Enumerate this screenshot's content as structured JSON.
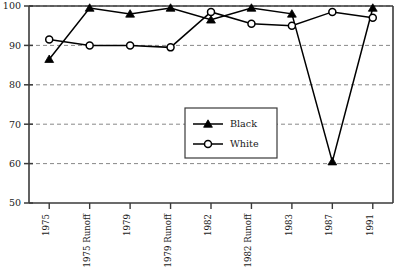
{
  "chart_data": {
    "type": "line",
    "title": "",
    "xlabel": "",
    "ylabel": "",
    "grid": true,
    "legend_position": "center",
    "ylim": [
      50,
      100
    ],
    "yticks": [
      50,
      60,
      70,
      80,
      90,
      100
    ],
    "ytick_labels": [
      "50",
      "60",
      "70",
      "80",
      "90",
      "100"
    ],
    "categories": [
      "1975",
      "1975 Runoff",
      "1979",
      "1979 Runoff",
      "1982",
      "1982 Runoff",
      "1983",
      "1987",
      "1991"
    ],
    "series": [
      {
        "name": "Black",
        "marker": "filled-triangle",
        "color": "#000000",
        "values": [
          86.5,
          99.5,
          98.0,
          99.5,
          96.5,
          99.5,
          98.0,
          60.5,
          99.5
        ]
      },
      {
        "name": "White",
        "marker": "open-circle",
        "color": "#000000",
        "values": [
          91.5,
          90.0,
          90.0,
          89.5,
          98.5,
          95.5,
          95.0,
          98.5,
          97.0
        ]
      }
    ]
  },
  "legend": {
    "entries": [
      {
        "label": "Black"
      },
      {
        "label": "White"
      }
    ]
  },
  "colors": {
    "line": "#000000",
    "axis": "#3a3a3a",
    "grid": "#7a7a7a",
    "background": "#ffffff"
  }
}
